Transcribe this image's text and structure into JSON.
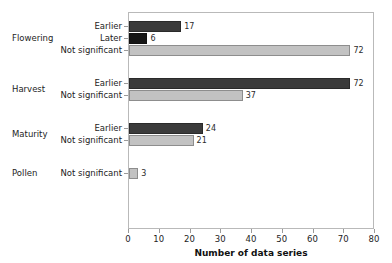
{
  "chart_data": {
    "type": "bar",
    "orientation": "horizontal",
    "title": "",
    "xlabel": "Number of data series",
    "ylabel": "",
    "xlim": [
      0,
      80
    ],
    "xticks": [
      0,
      10,
      20,
      30,
      40,
      50,
      60,
      70,
      80
    ],
    "grid": false,
    "legend": null,
    "groups": [
      {
        "name": "Flowering",
        "bars": [
          {
            "category": "Earlier",
            "value": 17,
            "label": "17",
            "color": "#3b3b3b",
            "style": "dark"
          },
          {
            "category": "Later",
            "value": 6,
            "label": "6",
            "color": "#161616",
            "style": "black"
          },
          {
            "category": "Not significant",
            "value": 72,
            "label": "72",
            "color": "#c2c2c2",
            "style": "light"
          }
        ]
      },
      {
        "name": "Harvest",
        "bars": [
          {
            "category": "Earlier",
            "value": 72,
            "label": "72",
            "color": "#3b3b3b",
            "style": "dark"
          },
          {
            "category": "Not significant",
            "value": 37,
            "label": "37",
            "color": "#c2c2c2",
            "style": "light"
          }
        ]
      },
      {
        "name": "Maturity",
        "bars": [
          {
            "category": "Earlier",
            "value": 24,
            "label": "24",
            "color": "#3b3b3b",
            "style": "dark"
          },
          {
            "category": "Not significant",
            "value": 21,
            "label": "21",
            "color": "#c2c2c2",
            "style": "light"
          }
        ]
      },
      {
        "name": "Pollen",
        "bars": [
          {
            "category": "Not significant",
            "value": 3,
            "label": "3",
            "color": "#c2c2c2",
            "style": "light"
          }
        ]
      }
    ],
    "colors": {
      "earlier": "#3b3b3b",
      "later": "#161616",
      "not_significant": "#c2c2c2",
      "axis": "#9a9a9a",
      "frame": "#b9b9b9",
      "text": "#1d1d1d",
      "background": "#ffffff"
    }
  }
}
